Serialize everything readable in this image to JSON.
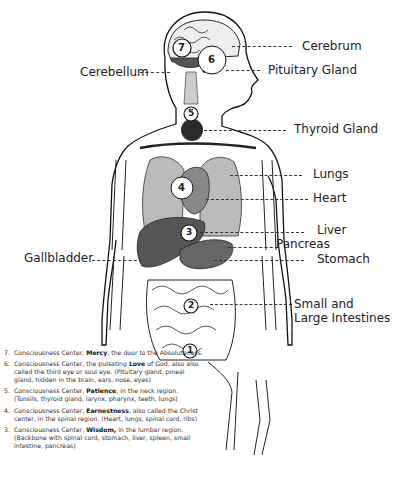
{
  "labels": {
    "cerebrum": "Cerebrum",
    "pituitary": "Pituitary Gland",
    "cerebellum": "Cerebellum",
    "thyroid": "Thyroid Gland",
    "lungs": "Lungs",
    "heart": "Heart",
    "liver": "Liver",
    "pancreas": "Pancreas",
    "gallbladder": "Gallbladder",
    "stomach": "Stomach",
    "intestines_line1": "Small and",
    "intestines_line2": "Large Intestines"
  },
  "centers": [
    {
      "num": "7",
      "x": 182,
      "y": 48
    },
    {
      "num": "6",
      "x": 212,
      "y": 60
    },
    {
      "num": "5",
      "x": 191,
      "y": 114
    },
    {
      "num": "4",
      "x": 182,
      "y": 188
    },
    {
      "num": "3",
      "x": 189,
      "y": 233
    },
    {
      "num": "2",
      "x": 191,
      "y": 306
    },
    {
      "num": "1",
      "x": 190,
      "y": 351
    }
  ],
  "legend": [
    {
      "num": "7.",
      "pre": "Consciousness Center, ",
      "bold": "Mercy",
      "post": ", the door to the Absoluteness."
    },
    {
      "num": "6.",
      "pre": "Consciousness Center, the pulsating ",
      "bold": "Love",
      "post": " of God, also also called the third eye or soul eye. (Pituitary gland, pineal gland, hidden in the brain, ears, nose, eyes)"
    },
    {
      "num": "5.",
      "pre": "Consciousness Center, ",
      "bold": "Patience",
      "post": ", in the neck region. (Tonsils, thyroid gland, larynx, pharynx, teeth, lungs)"
    },
    {
      "num": "4.",
      "pre": "Consciousness Center, ",
      "bold": "Earnestness",
      "post": ", also called the Christ center, in the spinal region. (Heart, lungs, spinal cord, ribs)"
    },
    {
      "num": "3.",
      "pre": "Consciousness Center, ",
      "bold": "Wisdom,",
      "post": " in the lumbar region. (Backbone with spinal cord, stomach, liver, spleen, small intestine, pancreas)"
    }
  ]
}
